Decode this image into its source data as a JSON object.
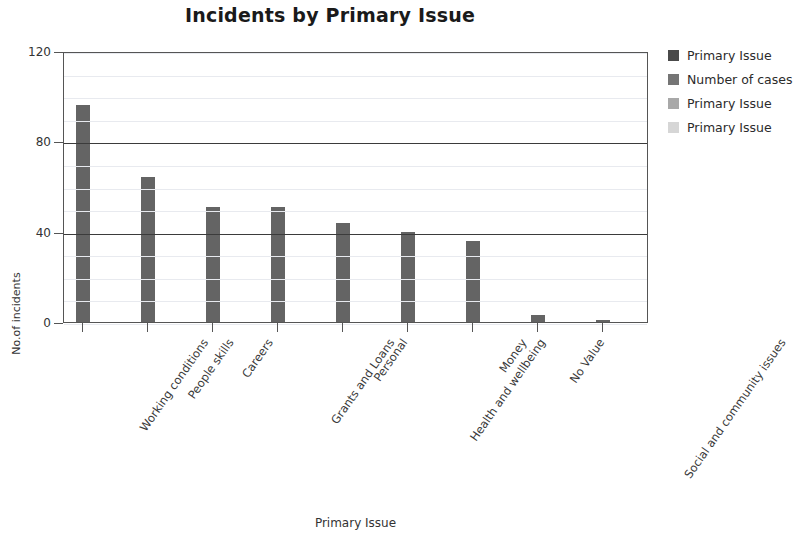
{
  "chart_data": {
    "type": "bar",
    "title": "Incidents by Primary Issue",
    "xlabel": "Primary Issue",
    "ylabel": "No.of incidents",
    "categories": [
      "Working conditions",
      "People skills",
      "Careers",
      "Grants and Loans",
      "Personal",
      "Health and wellbeing",
      "Money",
      "No Value",
      "Social and community issues"
    ],
    "values": [
      96,
      64,
      51,
      51,
      44,
      40,
      36,
      3,
      1
    ],
    "series": [
      {
        "name": "Number of cases",
        "values": [
          96,
          64,
          51,
          51,
          44,
          40,
          36,
          3,
          1
        ]
      }
    ],
    "ylim": [
      0,
      120
    ],
    "yticks": [
      0,
      40,
      80,
      120
    ],
    "ytick_labels": [
      "0",
      "40",
      "80",
      "120"
    ],
    "minor_gridline_step": 10,
    "major_gridlines": [
      40,
      80
    ],
    "grid": true,
    "legend_position": "right",
    "bar_color": "#646464",
    "axis_color": "#555555",
    "major_grid_color": "#3b3b3b",
    "minor_grid_color": "#e8eaef",
    "background": "#ffffff"
  },
  "legend": {
    "items": [
      {
        "label": "Primary Issue",
        "color": "#4a4a4a"
      },
      {
        "label": "Number of cases",
        "color": "#757575"
      },
      {
        "label": "Primary Issue",
        "color": "#a8a8a8"
      },
      {
        "label": "Primary Issue",
        "color": "#d6d6d6"
      }
    ]
  }
}
